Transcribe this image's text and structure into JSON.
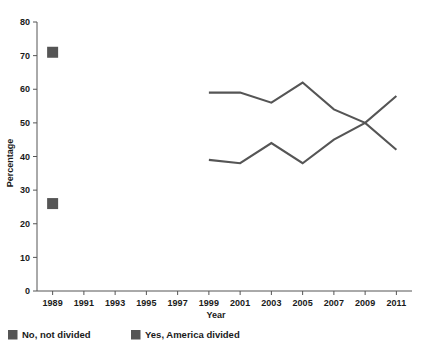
{
  "chart_data": {
    "type": "line",
    "title": "",
    "subtitle": "",
    "xlabel": "Year",
    "ylabel": "Percentage",
    "xlim": [
      1988,
      2012
    ],
    "ylim": [
      0,
      80
    ],
    "grid": false,
    "legend_position": "bottom",
    "xticks": [
      1989,
      1991,
      1993,
      1995,
      1997,
      1999,
      2001,
      2003,
      2005,
      2007,
      2009,
      2011
    ],
    "xtick_labels": [
      "1989",
      "1991",
      "1993",
      "1995",
      "1997",
      "1999",
      "2001",
      "2003",
      "2005",
      "2007",
      "2009",
      "2011"
    ],
    "yticks": [
      0,
      10,
      20,
      30,
      40,
      50,
      60,
      70,
      80
    ],
    "ytick_labels": [
      "0",
      "10",
      "20",
      "30",
      "40",
      "50",
      "60",
      "70",
      "80"
    ],
    "series": [
      {
        "name": "Yes, America divided",
        "color": "#555555",
        "marker_color": "#555555",
        "style": "line-with-isolated-marker",
        "points": [
          {
            "x": 1989,
            "y": 71,
            "rendered_as": "marker"
          },
          {
            "x": 1999,
            "y": 59,
            "rendered_as": "line"
          },
          {
            "x": 2000,
            "y": 59,
            "rendered_as": "line"
          },
          {
            "x": 2001,
            "y": 59,
            "rendered_as": "line"
          },
          {
            "x": 2003,
            "y": 56,
            "rendered_as": "line"
          },
          {
            "x": 2004,
            "y": 59,
            "rendered_as": "line"
          },
          {
            "x": 2005,
            "y": 62,
            "rendered_as": "line"
          },
          {
            "x": 2007,
            "y": 54,
            "rendered_as": "line"
          },
          {
            "x": 2009,
            "y": 50,
            "rendered_as": "line"
          },
          {
            "x": 2011,
            "y": 42,
            "rendered_as": "line"
          }
        ]
      },
      {
        "name": "No, not divided",
        "color": "#555555",
        "marker_color": "#555555",
        "style": "line-with-isolated-marker",
        "points": [
          {
            "x": 1989,
            "y": 26,
            "rendered_as": "marker"
          },
          {
            "x": 1999,
            "y": 39,
            "rendered_as": "line"
          },
          {
            "x": 2001,
            "y": 38,
            "rendered_as": "line"
          },
          {
            "x": 2003,
            "y": 44,
            "rendered_as": "line"
          },
          {
            "x": 2005,
            "y": 38,
            "rendered_as": "line"
          },
          {
            "x": 2007,
            "y": 45,
            "rendered_as": "line"
          },
          {
            "x": 2009,
            "y": 50,
            "rendered_as": "line"
          },
          {
            "x": 2011,
            "y": 58,
            "rendered_as": "line"
          }
        ]
      }
    ]
  },
  "legend": {
    "items": [
      {
        "label": "No, not divided",
        "color": "#555555"
      },
      {
        "label": "Yes, America divided",
        "color": "#555555"
      }
    ]
  },
  "colors": {
    "series": "#555555",
    "axis": "#555555",
    "text": "#1a1a1a",
    "background": "#ffffff"
  }
}
